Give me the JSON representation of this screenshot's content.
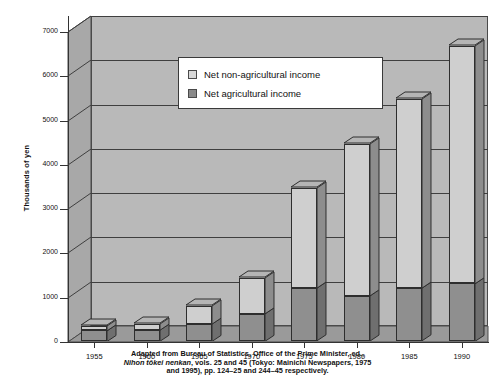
{
  "chart_data": {
    "type": "bar",
    "subtype": "stacked-3d-column",
    "title": "",
    "xlabel": "",
    "ylabel": "Thousands of yen",
    "categories": [
      "1955",
      "1960",
      "1965",
      "1970",
      "1975",
      "1980",
      "1985",
      "1990"
    ],
    "series": [
      {
        "name": "Net agricultural income",
        "color": "#8f8f8f",
        "values": [
          240,
          250,
          390,
          620,
          1190,
          1020,
          1190,
          1300
        ]
      },
      {
        "name": "Net non-agricultural income",
        "color": "#cfcfcf",
        "values": [
          110,
          140,
          410,
          810,
          2260,
          3430,
          4270,
          5370
        ]
      }
    ],
    "totals": [
      350,
      390,
      800,
      1430,
      3450,
      4450,
      5460,
      6670
    ],
    "ylim": [
      0,
      7000
    ],
    "yticks": [
      0,
      1000,
      2000,
      3000,
      4000,
      5000,
      6000,
      7000
    ],
    "ytick_labels": [
      "0",
      "1000",
      "2000",
      "3000",
      "4000",
      "5000",
      "6000",
      "7000"
    ],
    "grid": true,
    "legend_position": "top-left-inside"
  },
  "legend": {
    "items": [
      {
        "label": "Net non-agricultural income",
        "swatch": "light"
      },
      {
        "label": "Net agricultural income",
        "swatch": "dark"
      }
    ]
  },
  "caption": {
    "line1": "Adapted from Bureau of Statistics, Office of the Prime Minister, ed.,",
    "line2_italic": "Nihon tōkei nenkan",
    "line2_rest": ", vols. 25 and 45 (Tokyo: Mainichi Newspapers, 1975",
    "line3": "and 1995), pp. 124–25 and 244–45 respectively."
  },
  "colors": {
    "background": "#ffffff",
    "plot_wall": "#b9b9b9",
    "floor": "#9a9a9a",
    "bar_light": "#cfcfcf",
    "bar_dark": "#8f8f8f",
    "bar_side": "#6f6f6f",
    "axis": "#333333",
    "gridline": "#3f3f3f"
  }
}
